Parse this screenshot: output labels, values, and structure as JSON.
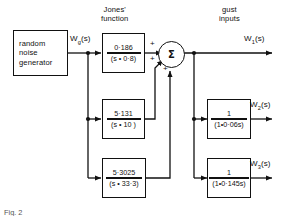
{
  "figure": {
    "caption": "Fig. 2",
    "line_color": "#111111",
    "background": "#ffffff"
  },
  "section_labels": {
    "jones": "Jones'\nfunction",
    "jones_line1": "Jones'",
    "jones_line2": "function",
    "gust_line1": "gust",
    "gust_line2": "inputs"
  },
  "source_block": {
    "name": "random-noise-generator",
    "line1": "random",
    "line2": "noise",
    "line3": "generator",
    "output_label": "Wg(s)"
  },
  "jones_blocks": [
    {
      "id": "jones-1",
      "numerator": "0·186",
      "denominator": "(s • 0·8)"
    },
    {
      "id": "jones-2",
      "numerator": "5·131",
      "denominator": "(s • 10 )"
    },
    {
      "id": "jones-3",
      "numerator": "5·3025",
      "denominator": "(s • 33·3)"
    }
  ],
  "summer": {
    "symbol": "Σ",
    "signs": [
      "+",
      "+",
      "+"
    ]
  },
  "gust_blocks": [
    {
      "id": "gust-2",
      "numerator": "1",
      "denominator": "(1•0·06s)",
      "output_label": "W2(s)"
    },
    {
      "id": "gust-3",
      "numerator": "1",
      "denominator": "(1•0·145s)",
      "output_label": "W3(s)"
    }
  ],
  "outputs": {
    "w1": "W1(s)",
    "w2": "W2(s)",
    "w3": "W3(s)"
  }
}
